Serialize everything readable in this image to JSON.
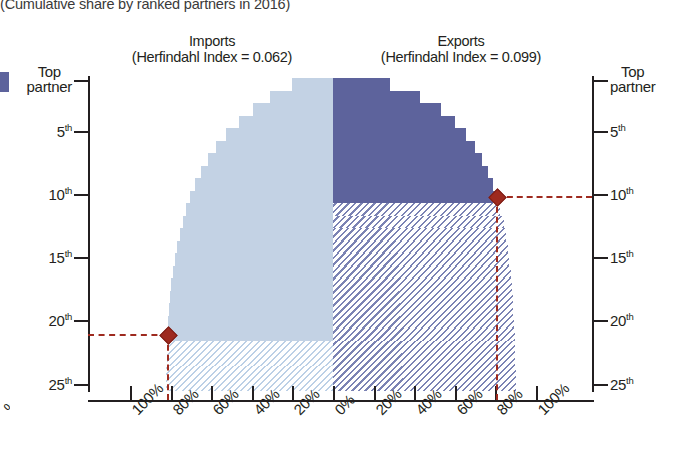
{
  "caption": "(Cumulative share by ranked partners in 2016)",
  "panels": {
    "imports": {
      "name": "Imports",
      "subtitle": "(Herfindahl Index = 0.062)"
    },
    "exports": {
      "name": "Exports",
      "subtitle": "(Herfindahl Index = 0.099)"
    }
  },
  "rank_axis": {
    "top_partner_line1": "Top",
    "top_partner_line2": "partner",
    "labels": [
      "5",
      "10",
      "15",
      "20",
      "25"
    ],
    "suffix": "th"
  },
  "x_axis": {
    "left_labels": [
      "100%",
      "80%",
      "60%",
      "40%",
      "20%",
      "0%"
    ],
    "right_labels": [
      "20%",
      "40%",
      "60%",
      "80%",
      "100%"
    ]
  },
  "edge_fragment": "%",
  "colors": {
    "imports_solid": "#c3d2e4",
    "exports_solid": "#5d639c",
    "imports_hatch": "#bcd0e6",
    "exports_hatch": "#7b83b4",
    "marker": "#9e2a1f",
    "axis": "#231f20"
  },
  "chart_data": {
    "type": "bar",
    "orientation": "horizontal-back-to-back",
    "title": "(Cumulative share by ranked partners in 2016)",
    "xlabel": "",
    "ylabel": "",
    "xlim": [
      -100,
      100
    ],
    "grid": false,
    "legend_position": "panel-titles",
    "categories": [
      "Top partner",
      "2nd",
      "3rd",
      "4th",
      "5th",
      "6th",
      "7th",
      "8th",
      "9th",
      "10th",
      "11th",
      "12th",
      "13th",
      "14th",
      "15th",
      "16th",
      "17th",
      "18th",
      "19th",
      "20th",
      "21st",
      "22nd",
      "23rd",
      "24th",
      "25th"
    ],
    "series": [
      {
        "name": "Imports",
        "herfindahl_index": 0.062,
        "direction": "left",
        "units": "% cumulative share",
        "values": [
          20.0,
          31.0,
          39.5,
          46.5,
          52.5,
          57.5,
          61.5,
          65.0,
          68.0,
          70.5,
          72.5,
          74.0,
          75.5,
          77.0,
          78.0,
          79.0,
          79.7,
          80.3,
          80.8,
          81.2,
          81.5,
          81.8,
          82.0,
          82.2,
          82.3
        ],
        "solid_through_rank": 21,
        "hatched_from_rank": 22,
        "marker": {
          "rank": 21,
          "value": 81.5,
          "label": ""
        }
      },
      {
        "name": "Exports",
        "herfindahl_index": 0.099,
        "direction": "right",
        "units": "% cumulative share",
        "values": [
          28.0,
          43.0,
          53.0,
          60.0,
          65.5,
          70.0,
          73.5,
          76.5,
          79.0,
          81.0,
          82.5,
          84.0,
          85.0,
          86.0,
          86.8,
          87.5,
          88.0,
          88.5,
          88.9,
          89.2,
          89.5,
          89.7,
          89.9,
          90.0,
          90.1
        ],
        "solid_through_rank": 10,
        "hatched_from_rank": 11,
        "marker": {
          "rank": 10,
          "value": 81.0,
          "label": ""
        }
      }
    ]
  }
}
